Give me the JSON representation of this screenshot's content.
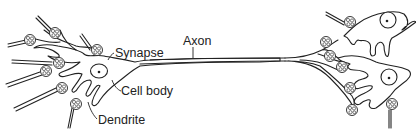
{
  "figure": {
    "labels": {
      "synapse": "Synapse",
      "axon": "Axon",
      "cell_body": "Cell body",
      "dendrite": "Dendrite"
    },
    "colors": {
      "line": "#222222",
      "background": "#ffffff"
    }
  }
}
